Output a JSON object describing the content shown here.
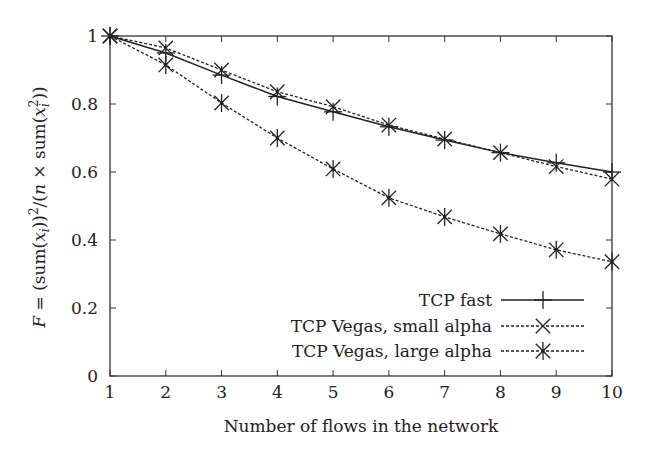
{
  "chart_data": {
    "type": "line",
    "title": "",
    "xlabel": "Number of flows in the network",
    "ylabel": "F = (sum(x_i))^2/(n × sum(x_i^2))",
    "xlim": [
      1,
      10
    ],
    "ylim": [
      0,
      1
    ],
    "x": [
      1,
      2,
      3,
      4,
      5,
      6,
      7,
      8,
      9,
      10
    ],
    "xticks": [
      "1",
      "2",
      "3",
      "4",
      "5",
      "6",
      "7",
      "8",
      "9",
      "10"
    ],
    "yticks": [
      "0",
      "0.2",
      "0.4",
      "0.6",
      "0.8",
      "1"
    ],
    "grid": false,
    "legend_position": "lower right",
    "series": [
      {
        "name": "TCP fast",
        "marker": "plus",
        "line": "solid",
        "values": [
          1.0,
          0.95,
          0.885,
          0.822,
          0.777,
          0.733,
          0.694,
          0.657,
          0.627,
          0.6
        ]
      },
      {
        "name": "TCP Vegas, small alpha",
        "marker": "cross",
        "line": "dashed",
        "values": [
          1.0,
          0.965,
          0.9,
          0.836,
          0.792,
          0.738,
          0.697,
          0.657,
          0.616,
          0.579
        ]
      },
      {
        "name": "TCP Vegas, large alpha",
        "marker": "star",
        "line": "dashed",
        "values": [
          1.0,
          0.915,
          0.803,
          0.7,
          0.609,
          0.524,
          0.468,
          0.418,
          0.371,
          0.336
        ]
      }
    ]
  },
  "colors": {
    "line": "#222222",
    "axis": "#333333",
    "background": "#ffffff"
  }
}
